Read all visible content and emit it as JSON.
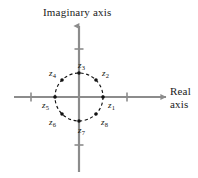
{
  "figure": {
    "title": "",
    "background_color": "#ffffff",
    "width": 198,
    "height": 178
  },
  "axes": {
    "imaginary": {
      "label": "Imaginary axis",
      "orientation": "vertical",
      "arrow": "up",
      "color": "#8c8c8c",
      "ticks": [
        {
          "name": "imaginary-tick-positive",
          "value": 2
        },
        {
          "name": "imaginary-tick-negative",
          "value": -2
        }
      ]
    },
    "real": {
      "label_line1": "Real",
      "label_line2": "axis",
      "orientation": "horizontal",
      "arrow": "right",
      "color": "#8c8c8c",
      "ticks": [
        {
          "name": "real-tick-negative",
          "value": -2
        },
        {
          "name": "real-tick-positive",
          "value": 2
        }
      ]
    }
  },
  "chart_data": {
    "type": "scatter",
    "xlabel": "Real axis",
    "ylabel": "Imaginary axis",
    "xlim": [
      -2.8,
      2.8
    ],
    "ylim": [
      -2.6,
      2.6
    ],
    "grid": false,
    "legend": null,
    "unit_circle": {
      "center": [
        0,
        0
      ],
      "radius": 1,
      "style": "dashed",
      "color": "#111111"
    },
    "points": [
      {
        "label": "z₁",
        "name": "z1",
        "base": "z",
        "sub": "1",
        "angle_deg": 0,
        "x": 1.0,
        "y": 0.0,
        "label_pos": "below-right"
      },
      {
        "label": "z₂",
        "name": "z2",
        "base": "z",
        "sub": "2",
        "angle_deg": 45,
        "x": 0.7071,
        "y": 0.7071,
        "label_pos": "above-right"
      },
      {
        "label": "z₃",
        "name": "z3",
        "base": "z",
        "sub": "3",
        "angle_deg": 90,
        "x": 0.0,
        "y": 1.0,
        "label_pos": "above"
      },
      {
        "label": "z₄",
        "name": "z4",
        "base": "z",
        "sub": "4",
        "angle_deg": 135,
        "x": -0.7071,
        "y": 0.7071,
        "label_pos": "above-left"
      },
      {
        "label": "z₅",
        "name": "z5",
        "base": "z",
        "sub": "5",
        "angle_deg": 180,
        "x": -1.0,
        "y": 0.0,
        "label_pos": "below-left"
      },
      {
        "label": "z₆",
        "name": "z6",
        "base": "z",
        "sub": "6",
        "angle_deg": 225,
        "x": -0.7071,
        "y": -0.7071,
        "label_pos": "below-left"
      },
      {
        "label": "z₇",
        "name": "z7",
        "base": "z",
        "sub": "7",
        "angle_deg": 270,
        "x": 0.0,
        "y": -1.0,
        "label_pos": "below"
      },
      {
        "label": "z₈",
        "name": "z8",
        "base": "z",
        "sub": "8",
        "angle_deg": 315,
        "x": 0.7071,
        "y": -0.7071,
        "label_pos": "below-right"
      }
    ],
    "marker": {
      "shape": "circle",
      "color": "#111111",
      "size_px": 3.6
    }
  }
}
